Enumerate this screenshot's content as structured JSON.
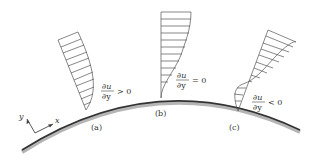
{
  "diagram": {
    "axes": {
      "x_label": "x",
      "y_label": "y"
    },
    "profiles": [
      {
        "id": "a",
        "label": "(a)",
        "grad_num": "∂u",
        "grad_den": "∂y",
        "relation": "> 0"
      },
      {
        "id": "b",
        "label": "(b)",
        "grad_num": "∂u",
        "grad_den": "∂y",
        "relation": "= 0"
      },
      {
        "id": "c",
        "label": "(c)",
        "grad_num": "∂u",
        "grad_den": "∂y",
        "relation": "< 0"
      }
    ],
    "colors": {
      "line": "#555555",
      "surface": "#333333",
      "surface_shadow": "#b0b0b0"
    }
  }
}
